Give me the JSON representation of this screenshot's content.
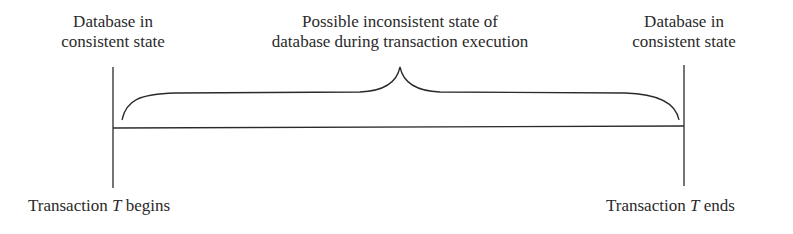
{
  "diagram": {
    "left_top_label": {
      "line1": "Database in",
      "line2": "consistent state"
    },
    "center_top_label": {
      "line1": "Possible inconsistent state of",
      "line2": "database during transaction execution"
    },
    "right_top_label": {
      "line1": "Database in",
      "line2": "consistent state"
    },
    "left_bottom_label": {
      "prefix": "Transaction ",
      "var": "T",
      "suffix": " begins"
    },
    "right_bottom_label": {
      "prefix": "Transaction ",
      "var": "T",
      "suffix": " ends"
    },
    "line_color": "#2a2a2a"
  }
}
